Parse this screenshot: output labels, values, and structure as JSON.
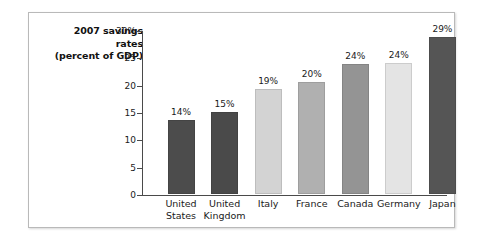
{
  "chart_data": {
    "type": "bar",
    "title": "2007 savings rates (percent of GDP)",
    "title_lines": [
      "2007 savings",
      "rates",
      "(percent of GDP)"
    ],
    "xlabel": "",
    "ylabel": "percent of GDP",
    "ylim": [
      0,
      30
    ],
    "grid": false,
    "legend": "none",
    "y_ticks": [
      {
        "value": 30,
        "label": "30%"
      },
      {
        "value": 25,
        "label": "25"
      },
      {
        "value": 20,
        "label": "20"
      },
      {
        "value": 15,
        "label": "15"
      },
      {
        "value": 10,
        "label": "10"
      },
      {
        "value": 5,
        "label": "5"
      },
      {
        "value": 0,
        "label": "0"
      }
    ],
    "categories": [
      "United States",
      "United Kingdom",
      "Italy",
      "France",
      "Canada",
      "Germany",
      "Japan"
    ],
    "category_lines": [
      [
        "United",
        "States"
      ],
      [
        "United",
        "Kingdom"
      ],
      [
        "Italy",
        ""
      ],
      [
        "France",
        ""
      ],
      [
        "Canada",
        ""
      ],
      [
        "Germany",
        ""
      ],
      [
        "Japan",
        ""
      ]
    ],
    "values": [
      13.6,
      15.0,
      19.3,
      20.5,
      23.8,
      24.0,
      28.7
    ],
    "data_labels": [
      "14%",
      "15%",
      "19%",
      "20%",
      "24%",
      "24%",
      "29%"
    ],
    "bar_colors": [
      "#4c4c4c",
      "#4a4a4a",
      "#d3d3d3",
      "#b0b0b0",
      "#949494",
      "#e4e4e4",
      "#555555"
    ]
  },
  "colors": {
    "panel_border": "#b9b9b9",
    "axis": "#4a4a4a",
    "text": "#1a1a1a",
    "background": "#ffffff"
  }
}
